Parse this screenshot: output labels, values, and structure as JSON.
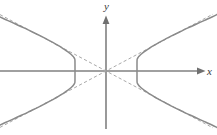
{
  "figure": {
    "kind": "coordinate-plane-diagram",
    "width": 217,
    "height": 135,
    "background_color": "#ffffff"
  },
  "axes": {
    "x_label": "x",
    "y_label": "y",
    "origin": {
      "x": 106,
      "y": 71
    },
    "x_axis": {
      "name": "x-axis",
      "x_start": 0,
      "x_end": 205,
      "y": 71,
      "color": "#808080",
      "arrow": "right"
    },
    "y_axis": {
      "name": "y-axis",
      "x": 106,
      "y_start": 128,
      "y_end": 16,
      "color": "#808080",
      "arrow": "up"
    }
  },
  "chart_data": {
    "type": "line",
    "title": "",
    "xlabel": "x",
    "ylabel": "y",
    "grid": false,
    "legend": false,
    "curve_kind": "hyperbola",
    "orientation": "horizontal-transverse-axis",
    "center": [
      0,
      0
    ],
    "vertices": [
      [
        -31,
        0
      ],
      [
        31,
        0
      ]
    ],
    "semi_axis_a": 31,
    "semi_axis_b": 16.5,
    "asymptote_slopes": [
      0.532,
      -0.532
    ],
    "xlim": [
      -106,
      111
    ],
    "ylim": [
      -57,
      71
    ],
    "series": [
      {
        "name": "hyperbola-left-branch",
        "style": "solid",
        "color": "#8a8a8a",
        "points": [
          [
            -106,
            54
          ],
          [
            -100,
            51.3
          ],
          [
            -94,
            48.6
          ],
          [
            -88,
            45.8
          ],
          [
            -82,
            43.1
          ],
          [
            -76,
            40.2
          ],
          [
            -70,
            37.3
          ],
          [
            -64,
            34.3
          ],
          [
            -58,
            31.2
          ],
          [
            -52,
            27.9
          ],
          [
            -48,
            25.6
          ],
          [
            -44,
            23.2
          ],
          [
            -41,
            21.2
          ],
          [
            -38,
            19.1
          ],
          [
            -36,
            17.5
          ],
          [
            -34,
            15.7
          ],
          [
            -33,
            14.7
          ],
          [
            -32,
            13.4
          ],
          [
            -31.4,
            12.3
          ],
          [
            -31.05,
            10.5
          ],
          [
            -31,
            0
          ],
          [
            -31.05,
            -10.5
          ],
          [
            -31.4,
            -12.3
          ],
          [
            -32,
            -13.4
          ],
          [
            -33,
            -14.7
          ],
          [
            -34,
            -15.7
          ],
          [
            -36,
            -17.5
          ],
          [
            -38,
            -19.1
          ],
          [
            -41,
            -21.2
          ],
          [
            -44,
            -23.2
          ],
          [
            -48,
            -25.6
          ],
          [
            -52,
            -27.9
          ],
          [
            -58,
            -31.2
          ],
          [
            -64,
            -34.3
          ],
          [
            -70,
            -37.3
          ],
          [
            -76,
            -40.2
          ],
          [
            -82,
            -43.1
          ],
          [
            -88,
            -45.8
          ],
          [
            -94,
            -48.6
          ],
          [
            -100,
            -51.3
          ],
          [
            -106,
            -54
          ]
        ]
      },
      {
        "name": "hyperbola-right-branch",
        "style": "solid",
        "color": "#8a8a8a",
        "points": [
          [
            111,
            56.5
          ],
          [
            106,
            54
          ],
          [
            100,
            51.3
          ],
          [
            94,
            48.6
          ],
          [
            88,
            45.8
          ],
          [
            82,
            43.1
          ],
          [
            76,
            40.2
          ],
          [
            70,
            37.3
          ],
          [
            64,
            34.3
          ],
          [
            58,
            31.2
          ],
          [
            52,
            27.9
          ],
          [
            48,
            25.6
          ],
          [
            44,
            23.2
          ],
          [
            41,
            21.2
          ],
          [
            38,
            19.1
          ],
          [
            36,
            17.5
          ],
          [
            34,
            15.7
          ],
          [
            33,
            14.7
          ],
          [
            32,
            13.4
          ],
          [
            31.4,
            12.3
          ],
          [
            31.05,
            10.5
          ],
          [
            31,
            0
          ],
          [
            31.05,
            -10.5
          ],
          [
            31.4,
            -12.3
          ],
          [
            32,
            -13.4
          ],
          [
            33,
            -14.7
          ],
          [
            34,
            -15.7
          ],
          [
            36,
            -17.5
          ],
          [
            38,
            -19.1
          ],
          [
            41,
            -21.2
          ],
          [
            44,
            -23.2
          ],
          [
            48,
            -25.6
          ],
          [
            52,
            -27.9
          ],
          [
            58,
            -31.2
          ],
          [
            64,
            -34.3
          ],
          [
            70,
            -37.3
          ],
          [
            76,
            -40.2
          ],
          [
            82,
            -43.1
          ],
          [
            88,
            -45.8
          ],
          [
            94,
            -48.6
          ],
          [
            100,
            -51.3
          ],
          [
            106,
            -54
          ],
          [
            111,
            -56.5
          ]
        ]
      },
      {
        "name": "asymptote-positive-slope",
        "style": "dashed",
        "color": "#a9a9a9",
        "points": [
          [
            -106,
            -56.4
          ],
          [
            107,
            56.9
          ]
        ]
      },
      {
        "name": "asymptote-negative-slope",
        "style": "dashed",
        "color": "#a9a9a9",
        "points": [
          [
            -106,
            56.4
          ],
          [
            107,
            -56.9
          ]
        ]
      }
    ]
  },
  "colors": {
    "axis": "#808080",
    "curve": "#8a8a8a",
    "asymptote": "#a9a9a9",
    "label": "#3a3a3a",
    "background": "#ffffff"
  }
}
